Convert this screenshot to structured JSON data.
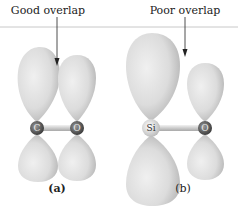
{
  "figure": {
    "panel_a": {
      "annotation": "Good overlap",
      "label": "(a)",
      "atoms": [
        "C",
        "O"
      ]
    },
    "panel_b": {
      "annotation": "Poor overlap",
      "label": "(b)",
      "atoms": [
        "Si",
        "O"
      ]
    }
  },
  "colors": {
    "orbital_light": "#e4e4e4",
    "orbital_shade": "#b8b8b8",
    "atom_dark": "#5a5a5a",
    "atom_si": "#dcdcdc",
    "rule": "#c8c8c8",
    "text": "#222222"
  }
}
